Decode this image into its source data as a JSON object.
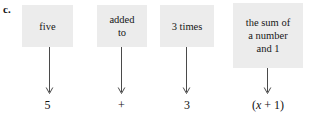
{
  "exercise": {
    "letter": "c."
  },
  "colors": {
    "box_fill": "#ececec",
    "text": "#171717",
    "arrow": "#4a4a4a",
    "page_background": "#ffffff"
  },
  "columns": [
    {
      "id": "col-1",
      "phrase": "five",
      "symbol": "5",
      "symbol_parts": [
        {
          "text": "5",
          "italic": false
        }
      ]
    },
    {
      "id": "col-2",
      "phrase": "added\nto",
      "symbol": "+",
      "symbol_parts": [
        {
          "text": "+",
          "italic": false
        }
      ]
    },
    {
      "id": "col-3",
      "phrase": "3 times",
      "symbol": "3",
      "symbol_parts": [
        {
          "text": "3",
          "italic": false
        }
      ]
    },
    {
      "id": "col-4",
      "phrase": "the sum of\na number\nand 1",
      "symbol": "(x + 1)",
      "symbol_parts": [
        {
          "text": "(",
          "italic": false
        },
        {
          "text": "x",
          "italic": true
        },
        {
          "text": " + 1)",
          "italic": false
        }
      ]
    }
  ]
}
